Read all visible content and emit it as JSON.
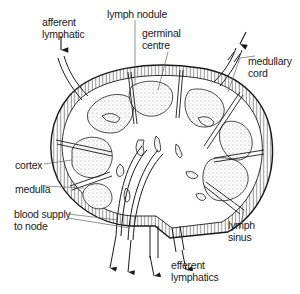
{
  "diagram": {
    "labels": {
      "afferent_lymphatic": "afferent\nlymphatic",
      "lymph_nodule": "lymph nodule",
      "germinal_centre": "germinal\ncentre",
      "medullary_cord": "medullary\ncord",
      "cortex": "cortex",
      "medulla": "medulla",
      "blood_supply": "blood supply\nto node",
      "lymph_sinus": "lymph\nsinus",
      "efferent_lymphatics": "efferent\nlymphatics"
    },
    "colors": {
      "ink": "#1a1a1a",
      "stipple": "#9a9a9a",
      "background": "#ffffff"
    }
  }
}
